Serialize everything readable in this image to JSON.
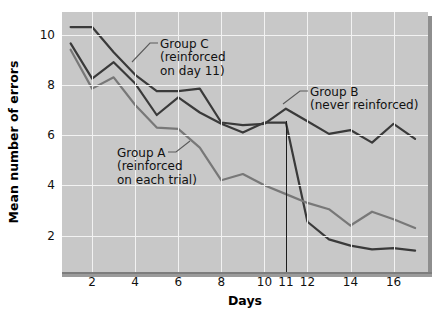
{
  "figure": {
    "xlabel": "Days",
    "ylabel": "Mean number of errors"
  },
  "annotations": {
    "group_c": "Group C\n(reinforced\non day 11)",
    "group_b": "Group B\n(never reinforced)",
    "group_a": "Group A\n(reinforced\non each trial)"
  },
  "axis": {
    "yticks": [
      "10",
      "8",
      "6",
      "4",
      "2"
    ],
    "xticks": [
      "2",
      "4",
      "6",
      "8",
      "10",
      "11",
      "12",
      "14",
      "16"
    ]
  },
  "chart_data": {
    "type": "line",
    "title": "",
    "xlabel": "Days",
    "ylabel": "Mean number of errors",
    "xlim": [
      0.6,
      17.6
    ],
    "ylim": [
      0.55,
      10.9
    ],
    "xticks": [
      2,
      4,
      6,
      8,
      10,
      11,
      12,
      14,
      16
    ],
    "yticks": [
      2,
      4,
      6,
      8,
      10
    ],
    "grid": true,
    "legend": "annotated-inline",
    "marker_line": {
      "x": 11,
      "label": "11",
      "color": "#1d1d1d"
    },
    "colors": {
      "group_a": "#787878",
      "group_b": "#3a3a3a",
      "group_c": "#3a3a3a"
    },
    "x": [
      1,
      2,
      3,
      4,
      5,
      6,
      7,
      8,
      9,
      10,
      11,
      12,
      13,
      14,
      15,
      16,
      17
    ],
    "series": [
      {
        "name": "Group B (never reinforced)",
        "color": "#3a3a3a",
        "values": [
          10.3,
          10.3,
          9.3,
          8.4,
          7.75,
          7.75,
          7.85,
          6.5,
          6.4,
          6.45,
          7.05,
          6.55,
          6.05,
          6.2,
          5.7,
          6.45,
          5.85
        ]
      },
      {
        "name": "Group C (reinforced on day 11)",
        "color": "#3a3a3a",
        "values": [
          9.65,
          8.25,
          8.9,
          8.05,
          6.8,
          7.5,
          6.9,
          6.45,
          6.1,
          6.5,
          6.5,
          2.55,
          1.85,
          1.6,
          1.45,
          1.5,
          1.4
        ]
      },
      {
        "name": "Group A (reinforced on each trial)",
        "color": "#787878",
        "values": [
          9.4,
          7.85,
          8.3,
          7.2,
          6.3,
          6.25,
          5.5,
          4.2,
          4.45,
          4.0,
          3.65,
          3.3,
          3.05,
          2.4,
          2.95,
          2.65,
          2.3
        ]
      }
    ]
  }
}
